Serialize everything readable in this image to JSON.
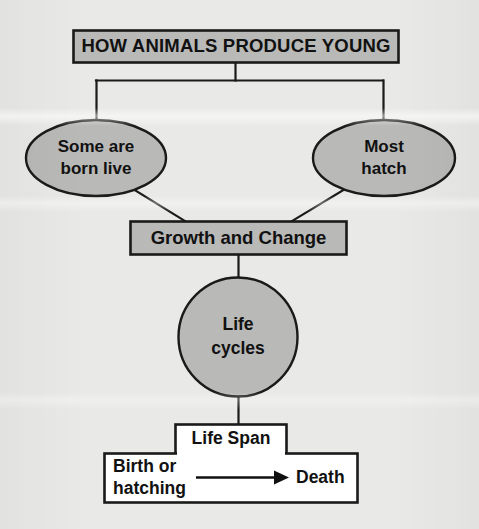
{
  "diagram": {
    "type": "flowchart",
    "title_node": {
      "label": "HOW ANIMALS PRODUCE YOUNG",
      "shape": "rectangle",
      "fill": "#b9b9b7",
      "border": "#1a1a1a"
    },
    "branch_nodes": [
      {
        "id": "born-live",
        "label_line1": "Some are",
        "label_line2": "born live",
        "shape": "ellipse",
        "fill": "#b9b9b7",
        "border": "#1a1a1a"
      },
      {
        "id": "hatch",
        "label_line1": "Most",
        "label_line2": "hatch",
        "shape": "ellipse",
        "fill": "#b9b9b7",
        "border": "#1a1a1a"
      }
    ],
    "growth_node": {
      "label": "Growth and Change",
      "shape": "rectangle",
      "fill": "#b9b9b7",
      "border": "#1a1a1a"
    },
    "cycle_node": {
      "label_line1": "Life",
      "label_line2": "cycles",
      "shape": "circle",
      "fill": "#b9b9b7",
      "border": "#1a1a1a"
    },
    "life_span": {
      "header_label": "Life Span",
      "start_line1": "Birth or",
      "start_line2": "hatching",
      "end_label": "Death",
      "arrow": "right-arrow",
      "fill": "#ffffff",
      "border": "#1a1a1a"
    },
    "background_color": "#e9e9e7"
  }
}
